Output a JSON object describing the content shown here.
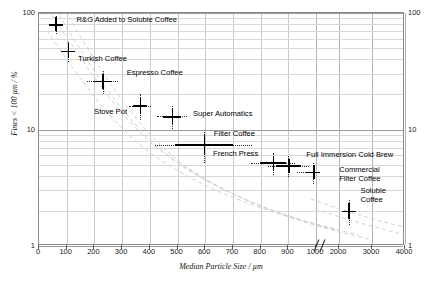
{
  "chart_data": {
    "type": "scatter",
    "title": "",
    "xlabel": "Median Particle Size / µm",
    "ylabel": "Fines < 100 µm / %",
    "xscale": "linear-with-break",
    "yscale": "log",
    "xlim": [
      0,
      4000
    ],
    "ylim": [
      1,
      100
    ],
    "x_break": {
      "from": 1000,
      "to": 2000,
      "marker": "//"
    },
    "grid": true,
    "legend": "none",
    "xticks": [
      0,
      100,
      200,
      300,
      400,
      500,
      600,
      700,
      800,
      900,
      1000,
      2000,
      3000,
      4000
    ],
    "yticks": [
      1,
      10,
      100
    ],
    "yticks_right": [
      1,
      10,
      100
    ],
    "points": [
      {
        "label": "R&G Added to Soluble Coffee",
        "x": 60,
        "y": 80,
        "xerr": 18,
        "yerr": 14,
        "lx": 21,
        "ly": -4
      },
      {
        "label": "Turkish Coffee",
        "x": 105,
        "y": 47,
        "xerr": 16,
        "yerr": 9,
        "lx": 10,
        "ly": 8
      },
      {
        "label": "Espresso Coffee",
        "x": 230,
        "y": 26,
        "xerr": 55,
        "yerr": 6,
        "lx": 24,
        "ly": -8
      },
      {
        "label": "Stove Pot",
        "x": 365,
        "y": 16,
        "xerr": 40,
        "yerr": 4,
        "lx": -46,
        "ly": 6
      },
      {
        "label": "Super Automatics",
        "x": 480,
        "y": 13,
        "xerr": 55,
        "yerr": 3,
        "lx": 21,
        "ly": -2
      },
      {
        "label": "Filter Coffee",
        "x": 595,
        "y": 7.4,
        "xerr": 175,
        "yerr": 2.2,
        "lx": 10,
        "ly": -11
      },
      {
        "label": "French Press",
        "x": 845,
        "y": 5.2,
        "xerr": 80,
        "yerr": 1.1,
        "lx": -60,
        "ly": -9
      },
      {
        "label": "Full Immersion Cold Brew",
        "x": 900,
        "y": 4.9,
        "xerr": 75,
        "yerr": 1.0,
        "lx": 18,
        "ly": -11
      },
      {
        "label": "Commercial Filter Coffee",
        "x": 990,
        "y": 4.3,
        "xerr": 60,
        "yerr": 0.9,
        "lx": 26,
        "ly": -2
      },
      {
        "label": "Soluble Coffee",
        "x": 2290,
        "y": 2.0,
        "xerr": 190,
        "yerr": 0.5,
        "lx": 12,
        "ly": -20
      }
    ],
    "trend_curves": 4,
    "trend_style": "dashed light-grey"
  },
  "axis": {
    "x_title": "Median Particle Size / µm",
    "y_title": "Fines < 100 µm / %",
    "x_tick_labels": [
      "0",
      "100",
      "200",
      "300",
      "400",
      "500",
      "600",
      "700",
      "800",
      "900",
      "1000",
      "2000",
      "3000",
      "4000"
    ],
    "y_tick_labels": [
      "100",
      "10",
      "1"
    ],
    "y_tick_labels_right": [
      "100",
      "10",
      "1"
    ],
    "break_marker": "//"
  },
  "labels": {
    "p0": "R&G Added to Soluble Coffee",
    "p1": "Turkish Coffee",
    "p2": "Espresso Coffee",
    "p3": "Stove Pot",
    "p4": "Super Automatics",
    "p5": "Filter Coffee",
    "p6": "French Press",
    "p7": "Full Immersion Cold Brew",
    "p8a": "Commercial",
    "p8b": "Filter Coffee",
    "p9a": "Soluble",
    "p9b": "Coffee"
  },
  "colors": {
    "frame": "#8a8a8a",
    "grid_major": "#9a9a9a",
    "grid_minor": "#d8d8d8",
    "marker": "#000000",
    "trend": "#cfcfcf",
    "background": "#ffffff"
  }
}
